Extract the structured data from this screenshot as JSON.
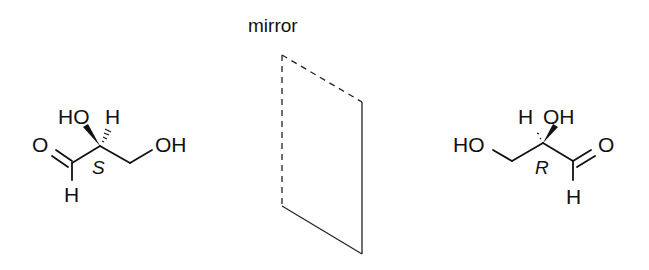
{
  "mirror": {
    "label": "mirror"
  },
  "left_molecule": {
    "name": "(S)-glyceraldehyde",
    "stereo_label": "S",
    "atoms": {
      "carbonyl_O": "O",
      "aldehyde_H": "H",
      "hydroxyl_top": "HO",
      "hydrogen_top": "H",
      "terminal_OH": "OH"
    }
  },
  "right_molecule": {
    "name": "(R)-glyceraldehyde",
    "stereo_label": "R",
    "atoms": {
      "carbonyl_O": "O",
      "aldehyde_H": "H",
      "hydroxyl_top": "OH",
      "hydrogen_top": "H",
      "terminal_OH": "HO"
    }
  }
}
